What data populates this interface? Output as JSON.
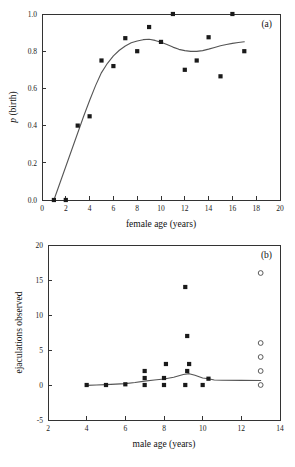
{
  "figure": {
    "panel_a_tag": "(a)",
    "panel_b_tag": "(b)"
  },
  "chart_data": [
    {
      "id": "panel-a",
      "type": "scatter",
      "title": "",
      "panel_label": "(a)",
      "xlabel": "female age (years)",
      "ylabel": "p (birth)",
      "ylabel_italic_prefix": "p",
      "ylabel_rest": " (birth)",
      "xlim": [
        0,
        20
      ],
      "ylim": [
        0.0,
        1.0
      ],
      "xticks": [
        0,
        2,
        4,
        6,
        8,
        10,
        12,
        14,
        16,
        18,
        20
      ],
      "xticklabels": [
        "0",
        "2",
        "4",
        "6",
        "8",
        "10",
        "12",
        "14",
        "16",
        "18",
        "20"
      ],
      "yticks": [
        0.0,
        0.2,
        0.4,
        0.6,
        0.8,
        1.0
      ],
      "yticklabels": [
        "0.0",
        "0.2",
        "0.4",
        "0.6",
        "0.8",
        "1.0"
      ],
      "grid": false,
      "legend": "none",
      "marker": "filled-square",
      "points": [
        {
          "x": 1,
          "y": 0.0
        },
        {
          "x": 2,
          "y": 0.0
        },
        {
          "x": 3,
          "y": 0.4
        },
        {
          "x": 4,
          "y": 0.45
        },
        {
          "x": 5,
          "y": 0.75
        },
        {
          "x": 6,
          "y": 0.72
        },
        {
          "x": 7,
          "y": 0.87
        },
        {
          "x": 8,
          "y": 0.8
        },
        {
          "x": 9,
          "y": 0.93
        },
        {
          "x": 10,
          "y": 0.85
        },
        {
          "x": 11,
          "y": 1.0
        },
        {
          "x": 12,
          "y": 0.7
        },
        {
          "x": 13,
          "y": 0.75
        },
        {
          "x": 14,
          "y": 0.875
        },
        {
          "x": 15,
          "y": 0.665
        },
        {
          "x": 16,
          "y": 1.0
        },
        {
          "x": 17,
          "y": 0.8
        }
      ],
      "fit_line": [
        {
          "x": 1.0,
          "y": 0.0
        },
        {
          "x": 1.5,
          "y": 0.09
        },
        {
          "x": 2.0,
          "y": 0.18
        },
        {
          "x": 2.5,
          "y": 0.27
        },
        {
          "x": 3.0,
          "y": 0.36
        },
        {
          "x": 3.5,
          "y": 0.45
        },
        {
          "x": 4.0,
          "y": 0.535
        },
        {
          "x": 4.5,
          "y": 0.615
        },
        {
          "x": 5.0,
          "y": 0.685
        },
        {
          "x": 5.5,
          "y": 0.735
        },
        {
          "x": 6.0,
          "y": 0.775
        },
        {
          "x": 6.5,
          "y": 0.805
        },
        {
          "x": 7.0,
          "y": 0.828
        },
        {
          "x": 7.5,
          "y": 0.845
        },
        {
          "x": 8.0,
          "y": 0.855
        },
        {
          "x": 8.5,
          "y": 0.862
        },
        {
          "x": 9.0,
          "y": 0.864
        },
        {
          "x": 9.5,
          "y": 0.858
        },
        {
          "x": 10.0,
          "y": 0.848
        },
        {
          "x": 10.5,
          "y": 0.836
        },
        {
          "x": 11.0,
          "y": 0.822
        },
        {
          "x": 11.5,
          "y": 0.81
        },
        {
          "x": 12.0,
          "y": 0.803
        },
        {
          "x": 12.5,
          "y": 0.799
        },
        {
          "x": 13.0,
          "y": 0.799
        },
        {
          "x": 13.5,
          "y": 0.803
        },
        {
          "x": 14.0,
          "y": 0.811
        },
        {
          "x": 14.5,
          "y": 0.82
        },
        {
          "x": 15.0,
          "y": 0.829
        },
        {
          "x": 15.5,
          "y": 0.836
        },
        {
          "x": 16.0,
          "y": 0.842
        },
        {
          "x": 16.5,
          "y": 0.847
        },
        {
          "x": 17.0,
          "y": 0.851
        }
      ]
    },
    {
      "id": "panel-b",
      "type": "scatter",
      "title": "",
      "panel_label": "(b)",
      "xlabel": "male age (years)",
      "ylabel": "ejaculations observed",
      "xlim": [
        2,
        14
      ],
      "ylim": [
        -5,
        20
      ],
      "xticks": [
        2,
        4,
        6,
        8,
        10,
        12,
        14
      ],
      "xticklabels": [
        "2",
        "4",
        "6",
        "8",
        "10",
        "12",
        "14"
      ],
      "yticks": [
        -5,
        0,
        5,
        10,
        15,
        20
      ],
      "yticklabels": [
        "-5",
        "0",
        "5",
        "10",
        "15",
        "20"
      ],
      "grid": false,
      "legend": "none",
      "marker": "filled-square",
      "open_marker": "open-circle",
      "points": [
        {
          "x": 4.0,
          "y": 0
        },
        {
          "x": 5.0,
          "y": 0
        },
        {
          "x": 6.0,
          "y": 0.1
        },
        {
          "x": 7.0,
          "y": 0
        },
        {
          "x": 7.0,
          "y": 1
        },
        {
          "x": 7.0,
          "y": 2
        },
        {
          "x": 8.0,
          "y": 0
        },
        {
          "x": 8.0,
          "y": 1
        },
        {
          "x": 8.1,
          "y": 3
        },
        {
          "x": 9.1,
          "y": 0
        },
        {
          "x": 9.2,
          "y": 2
        },
        {
          "x": 9.3,
          "y": 3
        },
        {
          "x": 9.2,
          "y": 7
        },
        {
          "x": 9.1,
          "y": 14
        },
        {
          "x": 10.0,
          "y": 0
        },
        {
          "x": 10.3,
          "y": 0.9
        }
      ],
      "open_points": [
        {
          "x": 13.0,
          "y": 0
        },
        {
          "x": 13.0,
          "y": 2
        },
        {
          "x": 13.0,
          "y": 4
        },
        {
          "x": 13.0,
          "y": 6
        },
        {
          "x": 13.0,
          "y": 16
        }
      ],
      "fit_line": [
        {
          "x": 4.0,
          "y": -0.05
        },
        {
          "x": 4.5,
          "y": 0.0
        },
        {
          "x": 5.0,
          "y": 0.05
        },
        {
          "x": 5.5,
          "y": 0.12
        },
        {
          "x": 6.0,
          "y": 0.2
        },
        {
          "x": 6.5,
          "y": 0.35
        },
        {
          "x": 7.0,
          "y": 0.55
        },
        {
          "x": 7.5,
          "y": 0.72
        },
        {
          "x": 8.0,
          "y": 0.85
        },
        {
          "x": 8.5,
          "y": 1.1
        },
        {
          "x": 9.0,
          "y": 1.5
        },
        {
          "x": 9.3,
          "y": 1.62
        },
        {
          "x": 9.6,
          "y": 1.4
        },
        {
          "x": 10.0,
          "y": 1.0
        },
        {
          "x": 10.3,
          "y": 0.9
        },
        {
          "x": 10.6,
          "y": 0.72
        },
        {
          "x": 11.0,
          "y": 0.68
        },
        {
          "x": 12.0,
          "y": 0.66
        },
        {
          "x": 13.0,
          "y": 0.65
        }
      ]
    }
  ]
}
